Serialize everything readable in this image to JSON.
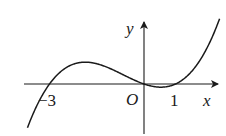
{
  "figure": {
    "axes": {
      "x_label": "x",
      "y_label": "y",
      "origin_label": "O"
    },
    "ticks": {
      "neg_three": "−3",
      "one": "1"
    },
    "colors": {
      "stroke": "#1a1a1a",
      "background": "#ffffff"
    }
  }
}
